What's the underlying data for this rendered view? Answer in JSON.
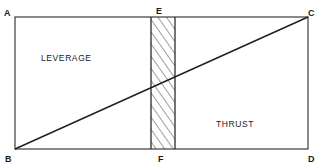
{
  "diagram": {
    "points": {
      "A": "A",
      "B": "B",
      "C": "C",
      "D": "D",
      "E": "E",
      "F": "F"
    },
    "regions": {
      "upper_left": "LEVERAGE",
      "lower_right": "THRUST"
    },
    "elements": {
      "outer_rectangle": "ABDC",
      "diagonal": "BC",
      "hatched_strip": "EF"
    },
    "colors": {
      "line": "#2a2a2a",
      "background": "#ffffff"
    }
  }
}
